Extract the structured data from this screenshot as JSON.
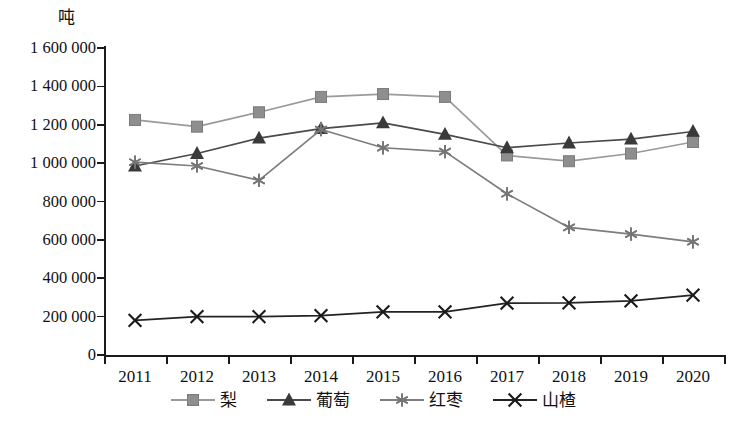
{
  "chart_data": {
    "type": "line",
    "title": "",
    "subtitle": "",
    "xlabel": "",
    "ylabel": "吨",
    "unit_label": "吨",
    "x": [
      "2011",
      "2012",
      "2013",
      "2014",
      "2015",
      "2016",
      "2017",
      "2018",
      "2019",
      "2020"
    ],
    "categories": [
      "2011",
      "2012",
      "2013",
      "2014",
      "2015",
      "2016",
      "2017",
      "2018",
      "2019",
      "2020"
    ],
    "ylim": [
      0,
      1600000
    ],
    "ytick_values": [
      0,
      200000,
      400000,
      600000,
      800000,
      1000000,
      1200000,
      1400000,
      1600000
    ],
    "ytick_labels": [
      "0",
      "200 000",
      "400 000",
      "600 000",
      "800 000",
      "1 000 000",
      "1 200 000",
      "1 400 000",
      "1 600 000"
    ],
    "grid": false,
    "legend_position": "bottom",
    "series": [
      {
        "name": "梨",
        "marker": "square",
        "color": "#8e8e8e",
        "line_color": "#9a9a9a",
        "values": [
          1225000,
          1190000,
          1265000,
          1345000,
          1360000,
          1345000,
          1040000,
          1010000,
          1050000,
          1110000
        ]
      },
      {
        "name": "葡萄",
        "marker": "triangle",
        "color": "#3a3a3a",
        "line_color": "#4a4a4a",
        "values": [
          985000,
          1050000,
          1130000,
          1180000,
          1210000,
          1150000,
          1080000,
          1105000,
          1125000,
          1165000
        ]
      },
      {
        "name": "红枣",
        "marker": "asterisk",
        "color": "#757575",
        "line_color": "#7d7d7d",
        "values": [
          1005000,
          985000,
          910000,
          1175000,
          1080000,
          1060000,
          840000,
          665000,
          630000,
          590000
        ]
      },
      {
        "name": "山楂",
        "marker": "cross",
        "color": "#1a1a1a",
        "line_color": "#232323",
        "values": [
          180000,
          200000,
          200000,
          205000,
          225000,
          225000,
          270000,
          272000,
          282000,
          312000
        ]
      }
    ]
  },
  "legend": {
    "items": [
      {
        "label": "梨"
      },
      {
        "label": "葡萄"
      },
      {
        "label": "红枣"
      },
      {
        "label": "山楂"
      }
    ]
  }
}
